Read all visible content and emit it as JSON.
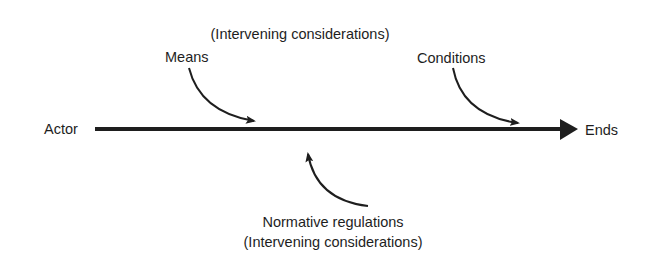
{
  "diagram": {
    "type": "action-schema",
    "nodes": {
      "actor": "Actor",
      "ends": "Ends",
      "means": "Means",
      "conditions": "Conditions",
      "top_note": "(Intervening considerations)",
      "normative": "Normative regulations",
      "bottom_note": "(Intervening considerations)"
    },
    "edges": [
      {
        "from": "Actor",
        "to": "Ends",
        "style": "thick-arrow"
      },
      {
        "from": "Means",
        "to": "Actor-Ends line",
        "style": "curved-arrow"
      },
      {
        "from": "Conditions",
        "to": "Actor-Ends line",
        "style": "curved-arrow"
      },
      {
        "from": "Normative regulations",
        "to": "Actor-Ends line",
        "style": "curved-arrow"
      }
    ],
    "colors": {
      "ink": "#1e1e1e",
      "background": "#ffffff"
    }
  }
}
